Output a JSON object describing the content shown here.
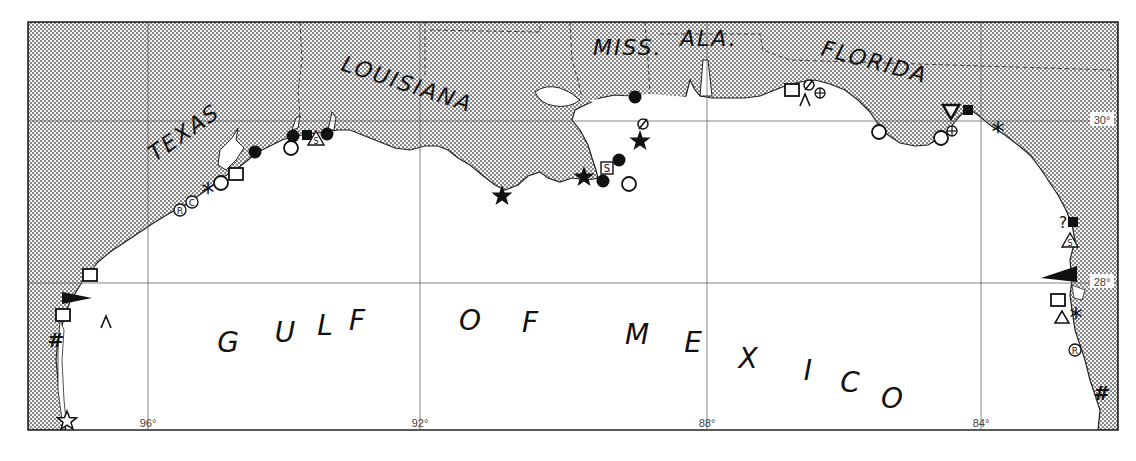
{
  "map": {
    "title": "Gulf of Mexico coastline",
    "water_label": "GULF OF MEXICO",
    "water_letters": [
      {
        "ch": "G",
        "x": 228,
        "y": 352
      },
      {
        "ch": "U",
        "x": 285,
        "y": 342
      },
      {
        "ch": "L",
        "x": 325,
        "y": 335
      },
      {
        "ch": "F",
        "x": 357,
        "y": 330
      },
      {
        "ch": "O",
        "x": 470,
        "y": 330
      },
      {
        "ch": "F",
        "x": 530,
        "y": 332
      },
      {
        "ch": "M",
        "x": 637,
        "y": 344
      },
      {
        "ch": "E",
        "x": 693,
        "y": 352
      },
      {
        "ch": "X",
        "x": 748,
        "y": 368
      },
      {
        "ch": "I",
        "x": 808,
        "y": 380
      },
      {
        "ch": "C",
        "x": 850,
        "y": 392
      },
      {
        "ch": "O",
        "x": 892,
        "y": 408
      }
    ],
    "state_labels": [
      {
        "id": "texas",
        "text": "TEXAS",
        "x": 155,
        "y": 162,
        "rotate": -35
      },
      {
        "id": "louisiana",
        "text": "LOUISIANA",
        "x": 340,
        "y": 70,
        "rotate": 18
      },
      {
        "id": "miss",
        "text": "MISS.",
        "x": 593,
        "y": 55,
        "rotate": 0
      },
      {
        "id": "ala",
        "text": "ALA.",
        "x": 680,
        "y": 46,
        "rotate": 0
      },
      {
        "id": "florida",
        "text": "FLORIDA",
        "x": 820,
        "y": 55,
        "rotate": 15
      }
    ],
    "longitude_ticks": [
      {
        "label": "96°",
        "x": 148
      },
      {
        "label": "92°",
        "x": 420
      },
      {
        "label": "88°",
        "x": 707
      },
      {
        "label": "84°",
        "x": 981
      }
    ],
    "latitude_ticks": [
      {
        "label": "30°",
        "y": 121
      },
      {
        "label": "28°",
        "y": 283
      }
    ],
    "symbols": [
      {
        "type": "filled-circle",
        "x": 255,
        "y": 152
      },
      {
        "type": "filled-circle",
        "x": 293,
        "y": 136
      },
      {
        "type": "open-circle",
        "x": 291,
        "y": 148
      },
      {
        "type": "filled-square",
        "x": 307,
        "y": 135
      },
      {
        "type": "triangle-s",
        "x": 316,
        "y": 139
      },
      {
        "type": "filled-circle",
        "x": 327,
        "y": 134
      },
      {
        "type": "open-square",
        "x": 236,
        "y": 174
      },
      {
        "type": "open-circle",
        "x": 221,
        "y": 183
      },
      {
        "type": "asterisk",
        "x": 208,
        "y": 191
      },
      {
        "type": "circle-c",
        "x": 192,
        "y": 202
      },
      {
        "type": "circle-r",
        "x": 180,
        "y": 210
      },
      {
        "type": "open-square",
        "x": 90,
        "y": 275
      },
      {
        "type": "black-flag-right",
        "x": 62,
        "y": 298
      },
      {
        "type": "open-square",
        "x": 63,
        "y": 315
      },
      {
        "type": "caret",
        "x": 106,
        "y": 322
      },
      {
        "type": "hash",
        "x": 56,
        "y": 340
      },
      {
        "type": "open-star",
        "x": 67,
        "y": 421
      },
      {
        "type": "filled-star",
        "x": 502,
        "y": 196
      },
      {
        "type": "filled-star",
        "x": 584,
        "y": 177
      },
      {
        "type": "filled-circle",
        "x": 603,
        "y": 181
      },
      {
        "type": "square-s",
        "x": 607,
        "y": 168
      },
      {
        "type": "filled-circle",
        "x": 619,
        "y": 160
      },
      {
        "type": "open-circle",
        "x": 629,
        "y": 184
      },
      {
        "type": "filled-star",
        "x": 640,
        "y": 141
      },
      {
        "type": "circle-slash",
        "x": 643,
        "y": 124
      },
      {
        "type": "filled-circle",
        "x": 635,
        "y": 97
      },
      {
        "type": "open-square",
        "x": 792,
        "y": 90
      },
      {
        "type": "circle-slash",
        "x": 809,
        "y": 85
      },
      {
        "type": "circle-plus",
        "x": 820,
        "y": 93
      },
      {
        "type": "caret",
        "x": 805,
        "y": 100
      },
      {
        "type": "open-circle",
        "x": 879,
        "y": 132
      },
      {
        "type": "open-down-triangle",
        "x": 951,
        "y": 112
      },
      {
        "type": "filled-square",
        "x": 968,
        "y": 110
      },
      {
        "type": "circle-plus",
        "x": 952,
        "y": 131
      },
      {
        "type": "open-circle",
        "x": 941,
        "y": 138
      },
      {
        "type": "asterisk",
        "x": 998,
        "y": 130
      },
      {
        "type": "question-mark",
        "x": 1063,
        "y": 222
      },
      {
        "type": "filled-square",
        "x": 1073,
        "y": 222
      },
      {
        "type": "triangle-s",
        "x": 1070,
        "y": 241
      },
      {
        "type": "black-flag-left",
        "x": 1063,
        "y": 278
      },
      {
        "type": "open-square",
        "x": 1058,
        "y": 300
      },
      {
        "type": "open-triangle",
        "x": 1062,
        "y": 318
      },
      {
        "type": "asterisk",
        "x": 1076,
        "y": 316
      },
      {
        "type": "circle-r",
        "x": 1075,
        "y": 350
      },
      {
        "type": "hash",
        "x": 1102,
        "y": 393
      }
    ],
    "colors": {
      "land_dots": "#555555",
      "water": "#ffffff",
      "ink": "#111111",
      "grid": "#666666"
    }
  }
}
